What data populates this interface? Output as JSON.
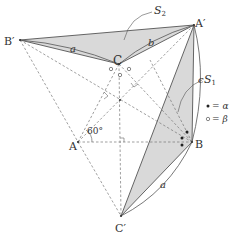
{
  "figure": {
    "type": "geometry-diagram",
    "points": {
      "A": "A",
      "B": "B",
      "C": "C",
      "A_prime": "A′",
      "B_prime": "B′",
      "C_prime": "C′"
    },
    "side_labels": {
      "a_top": "a",
      "b_top": "b",
      "c_right": "c",
      "a_bottom": "a"
    },
    "region_labels": {
      "S2": "S",
      "S2_sub": "2",
      "S1": "S",
      "S1_sub": "1"
    },
    "angle_label": "60°",
    "legend": {
      "filled_dot_eq": "= α",
      "open_dot_eq": "= β"
    },
    "colors": {
      "fill": "#d9d9d9",
      "stroke": "#555555",
      "dashed": "#777777",
      "text": "#333333"
    }
  }
}
